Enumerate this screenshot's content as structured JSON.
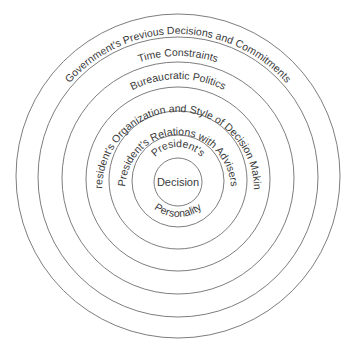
{
  "diagram": {
    "type": "concentric-circles",
    "center": {
      "x": 178,
      "y": 178
    },
    "stroke_color": "#6e6e6e",
    "text_color": "#3a3a3a",
    "rings": [
      {
        "label": "Government's Previous Decisions and Commitments",
        "radius": 162
      },
      {
        "label": "Time Constraints",
        "radius": 140
      },
      {
        "label": "Bureaucratic Politics",
        "radius": 116
      },
      {
        "label": "President's Organization and Style of Decision Making",
        "radius": 92
      },
      {
        "label": "President's Relations with Advisers",
        "radius": 69
      },
      {
        "label_top": "President's",
        "label_bottom": "Personality",
        "radius": 46
      },
      {
        "label": "Decision",
        "radius": 24
      }
    ]
  }
}
